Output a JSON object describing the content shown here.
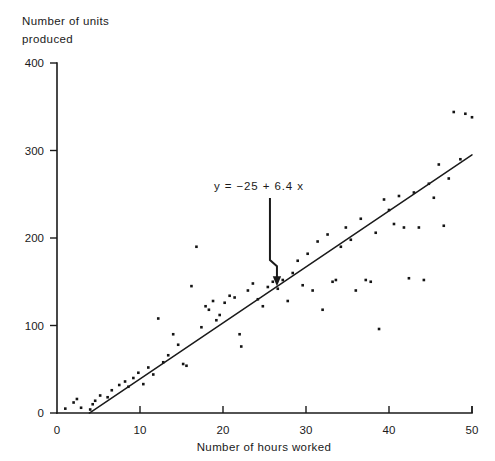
{
  "chart_data": {
    "type": "scatter",
    "title": "",
    "xlabel": "Number of hours worked",
    "ylabel_line1": "Number of units",
    "ylabel_line2": "produced",
    "xlim": [
      0,
      50
    ],
    "ylim": [
      0,
      400
    ],
    "xticks": [
      0,
      10,
      20,
      30,
      40,
      50
    ],
    "yticks": [
      0,
      100,
      200,
      300,
      400
    ],
    "grid": false,
    "legend": null,
    "annotations": [
      {
        "text": "y =  −25 + 6.4 x",
        "x": 26,
        "y": 235,
        "arrow_to_x": 26.5,
        "arrow_to_y": 145
      }
    ],
    "fit_line": {
      "label": "regression line",
      "intercept": -25,
      "slope": 6.4,
      "x_start": 3.9,
      "x_end": 50.0
    },
    "points": [
      [
        1.0,
        5
      ],
      [
        2.0,
        12
      ],
      [
        2.4,
        16
      ],
      [
        2.9,
        6
      ],
      [
        4.0,
        4
      ],
      [
        4.3,
        10
      ],
      [
        4.6,
        14
      ],
      [
        5.2,
        20
      ],
      [
        6.1,
        18
      ],
      [
        6.6,
        26
      ],
      [
        7.5,
        32
      ],
      [
        8.2,
        36
      ],
      [
        8.6,
        30
      ],
      [
        9.2,
        40
      ],
      [
        9.8,
        46
      ],
      [
        10.4,
        33
      ],
      [
        11.0,
        52
      ],
      [
        11.6,
        44
      ],
      [
        12.2,
        108
      ],
      [
        12.8,
        58
      ],
      [
        13.4,
        66
      ],
      [
        14.0,
        90
      ],
      [
        14.6,
        78
      ],
      [
        15.2,
        56
      ],
      [
        15.6,
        54
      ],
      [
        16.2,
        145
      ],
      [
        16.8,
        190
      ],
      [
        17.4,
        98
      ],
      [
        17.9,
        122
      ],
      [
        18.3,
        118
      ],
      [
        18.8,
        128
      ],
      [
        19.2,
        106
      ],
      [
        19.6,
        112
      ],
      [
        20.2,
        126
      ],
      [
        20.8,
        134
      ],
      [
        21.4,
        132
      ],
      [
        22.0,
        90
      ],
      [
        22.2,
        76
      ],
      [
        23.0,
        140
      ],
      [
        23.6,
        148
      ],
      [
        24.2,
        130
      ],
      [
        24.8,
        122
      ],
      [
        25.4,
        144
      ],
      [
        26.0,
        150
      ],
      [
        26.6,
        142
      ],
      [
        27.2,
        152
      ],
      [
        27.8,
        128
      ],
      [
        28.4,
        160
      ],
      [
        29.0,
        174
      ],
      [
        29.6,
        146
      ],
      [
        30.2,
        182
      ],
      [
        30.8,
        140
      ],
      [
        31.4,
        196
      ],
      [
        32.0,
        118
      ],
      [
        32.6,
        204
      ],
      [
        33.2,
        150
      ],
      [
        33.6,
        152
      ],
      [
        34.2,
        190
      ],
      [
        34.8,
        212
      ],
      [
        35.4,
        198
      ],
      [
        36.0,
        140
      ],
      [
        36.6,
        222
      ],
      [
        37.2,
        152
      ],
      [
        37.8,
        150
      ],
      [
        38.4,
        206
      ],
      [
        38.8,
        96
      ],
      [
        39.4,
        244
      ],
      [
        40.0,
        232
      ],
      [
        40.6,
        216
      ],
      [
        41.2,
        248
      ],
      [
        41.8,
        212
      ],
      [
        42.4,
        154
      ],
      [
        43.0,
        252
      ],
      [
        43.6,
        212
      ],
      [
        44.2,
        152
      ],
      [
        44.8,
        262
      ],
      [
        45.4,
        246
      ],
      [
        46.0,
        284
      ],
      [
        46.6,
        214
      ],
      [
        47.2,
        268
      ],
      [
        47.8,
        344
      ],
      [
        48.6,
        290
      ],
      [
        49.2,
        342
      ],
      [
        50.0,
        338
      ]
    ]
  }
}
